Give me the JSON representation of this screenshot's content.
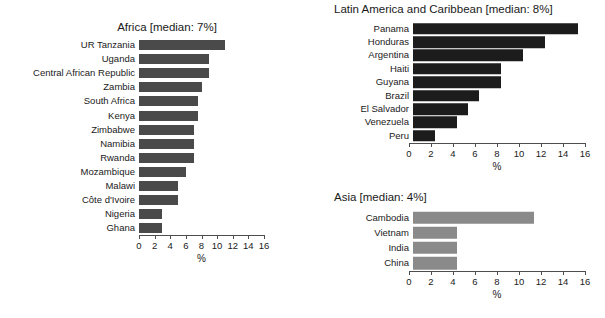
{
  "chart_data": [
    {
      "type": "bar",
      "orientation": "horizontal",
      "title": "Africa [median: 7%]",
      "xlabel": "%",
      "ylabel": "",
      "xlim": [
        0,
        16
      ],
      "xticks": [
        0,
        2,
        4,
        6,
        8,
        10,
        12,
        14,
        16
      ],
      "xtick_labels": [
        "0",
        "2",
        "4",
        "6",
        "8",
        "10",
        "12",
        "14",
        "16"
      ],
      "grid": false,
      "bar_color": "#4a4a4a",
      "median": 7,
      "categories": [
        "UR Tanzania",
        "Uganda",
        "Central African Republic",
        "Zambia",
        "South Africa",
        "Kenya",
        "Zimbabwe",
        "Namibia",
        "Rwanda",
        "Mozambique",
        "Malawi",
        "Côte d'Ivoire",
        "Nigeria",
        "Ghana"
      ],
      "values": [
        11,
        9,
        9,
        8,
        7.5,
        7.5,
        7,
        7,
        7,
        6,
        5,
        5,
        3,
        3
      ]
    },
    {
      "type": "bar",
      "orientation": "horizontal",
      "title": "Latin America and Caribbean [median: 8%]",
      "xlabel": "%",
      "ylabel": "",
      "xlim": [
        0,
        16
      ],
      "xticks": [
        0,
        2,
        4,
        6,
        8,
        10,
        12,
        14,
        16
      ],
      "xtick_labels": [
        "0",
        "2",
        "4",
        "6",
        "8",
        "10",
        "12",
        "14",
        "16"
      ],
      "grid": false,
      "bar_color": "#1c1c1c",
      "median": 8,
      "categories": [
        "Panama",
        "Honduras",
        "Argentina",
        "Haiti",
        "Guyana",
        "Brazil",
        "El Salvador",
        "Venezuela",
        "Peru"
      ],
      "values": [
        15,
        12,
        10,
        8,
        8,
        6,
        5,
        4,
        2
      ]
    },
    {
      "type": "bar",
      "orientation": "horizontal",
      "title": "Asia [median: 4%]",
      "xlabel": "%",
      "ylabel": "",
      "xlim": [
        0,
        16
      ],
      "xticks": [
        0,
        2,
        4,
        6,
        8,
        10,
        12,
        14,
        16
      ],
      "xtick_labels": [
        "0",
        "2",
        "4",
        "6",
        "8",
        "10",
        "12",
        "14",
        "16"
      ],
      "grid": false,
      "bar_color": "#8a8a8a",
      "median": 4,
      "categories": [
        "Cambodia",
        "Vietnam",
        "India",
        "China"
      ],
      "values": [
        11,
        4,
        4,
        4
      ]
    }
  ],
  "panels": {
    "africa": {
      "title": "Africa [median: 7%]",
      "axis_title": "%",
      "rows": [
        {
          "label": "UR Tanzania",
          "value": 11
        },
        {
          "label": "Uganda",
          "value": 9
        },
        {
          "label": "Central African Republic",
          "value": 9
        },
        {
          "label": "Zambia",
          "value": 8
        },
        {
          "label": "South Africa",
          "value": 7.5
        },
        {
          "label": "Kenya",
          "value": 7.5
        },
        {
          "label": "Zimbabwe",
          "value": 7
        },
        {
          "label": "Namibia",
          "value": 7
        },
        {
          "label": "Rwanda",
          "value": 7
        },
        {
          "label": "Mozambique",
          "value": 6
        },
        {
          "label": "Malawi",
          "value": 5
        },
        {
          "label": "Côte d'Ivoire",
          "value": 5
        },
        {
          "label": "Nigeria",
          "value": 3
        },
        {
          "label": "Ghana",
          "value": 3
        }
      ],
      "ticks": [
        "0",
        "2",
        "4",
        "6",
        "8",
        "10",
        "12",
        "14",
        "16"
      ],
      "color": "#4a4a4a"
    },
    "latam": {
      "title": "Latin America and Caribbean [median: 8%]",
      "axis_title": "%",
      "rows": [
        {
          "label": "Panama",
          "value": 15
        },
        {
          "label": "Honduras",
          "value": 12
        },
        {
          "label": "Argentina",
          "value": 10
        },
        {
          "label": "Haiti",
          "value": 8
        },
        {
          "label": "Guyana",
          "value": 8
        },
        {
          "label": "Brazil",
          "value": 6
        },
        {
          "label": "El Salvador",
          "value": 5
        },
        {
          "label": "Venezuela",
          "value": 4
        },
        {
          "label": "Peru",
          "value": 2
        }
      ],
      "ticks": [
        "0",
        "2",
        "4",
        "6",
        "8",
        "10",
        "12",
        "14",
        "16"
      ],
      "color": "#1c1c1c"
    },
    "asia": {
      "title": "Asia [median: 4%]",
      "axis_title": "%",
      "rows": [
        {
          "label": "Cambodia",
          "value": 11
        },
        {
          "label": "Vietnam",
          "value": 4
        },
        {
          "label": "India",
          "value": 4
        },
        {
          "label": "China",
          "value": 4
        }
      ],
      "ticks": [
        "0",
        "2",
        "4",
        "6",
        "8",
        "10",
        "12",
        "14",
        "16"
      ],
      "color": "#8a8a8a"
    }
  }
}
